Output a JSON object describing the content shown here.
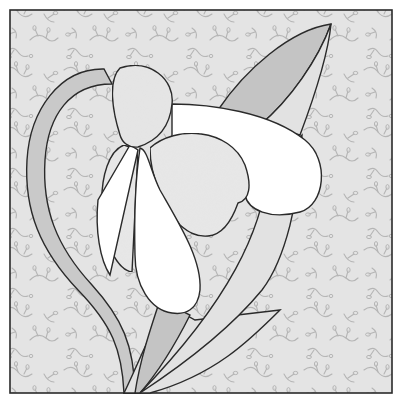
{
  "artwork": {
    "subject": "snowdrop flower quilt block",
    "colors": {
      "page_bg": "#ffffff",
      "background_fabric": "#e4e4e4",
      "vine_pattern": "#b8b8b8",
      "outline": "#2a2a2a",
      "stem": "#c9c9c9",
      "leaf_dark": "#c4c4c4",
      "leaf_light": "#e2e2e2",
      "cap": "#e6e6e6",
      "petal_white": "#ffffff",
      "petal_shaded": "#e8e8e8"
    },
    "pieces": [
      {
        "name": "background"
      },
      {
        "name": "stem"
      },
      {
        "name": "tall-leaf"
      },
      {
        "name": "lower-leaf"
      },
      {
        "name": "flower-cap"
      },
      {
        "name": "outer-petal-top"
      },
      {
        "name": "inner-petal-heart"
      },
      {
        "name": "left-petal"
      },
      {
        "name": "center-petal"
      }
    ]
  }
}
